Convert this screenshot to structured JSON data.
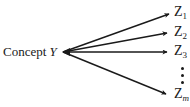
{
  "diagram": {
    "source": {
      "prefix": "Concept",
      "variable": "Y"
    },
    "targets": [
      {
        "letter": "Z",
        "subscript": "1"
      },
      {
        "letter": "Z",
        "subscript": "2"
      },
      {
        "letter": "Z",
        "subscript": "3"
      },
      {
        "letter": "Z",
        "subscript": "m"
      }
    ],
    "ellipsis": "vertical dots",
    "colors": {
      "ink": "#1a1a1a",
      "background": "#ffffff"
    }
  }
}
